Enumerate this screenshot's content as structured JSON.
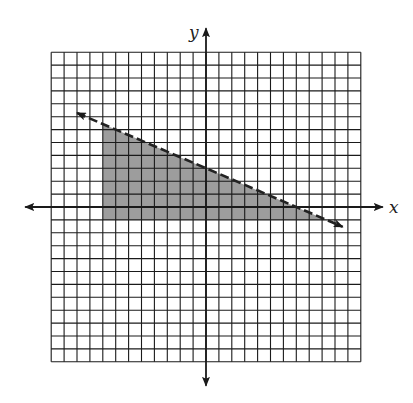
{
  "chart_data": {
    "type": "line",
    "title": "",
    "xlabel": "x",
    "ylabel": "y",
    "xlim": [
      -12,
      12
    ],
    "ylim": [
      -12,
      12
    ],
    "grid": true,
    "grid_step": 1,
    "tick_labels": "none",
    "series": [
      {
        "name": "boundary line",
        "style": "dashed",
        "equation": "y = -3/7 x + 3",
        "x": [
          -10,
          10.6
        ],
        "y": [
          7.29,
          -1.54
        ],
        "arrows": "both ends"
      }
    ],
    "shaded_region": {
      "description": "Region below dashed line, right of x = -8, above y = -1",
      "inequalities": [
        "y < -3/7 x + 3",
        "x >= -8",
        "y >= -1"
      ],
      "vertices": [
        [
          -8,
          6.43
        ],
        [
          -8,
          -1
        ],
        [
          9.33,
          -1
        ]
      ],
      "color": "#8c8c8c"
    },
    "annotations": []
  },
  "labels": {
    "x_axis": "x",
    "y_axis": "y"
  },
  "colors": {
    "grid": "#1a1a1a",
    "axis": "#1a1a1a",
    "shade": "#8c8c8c",
    "line": "#222222"
  }
}
